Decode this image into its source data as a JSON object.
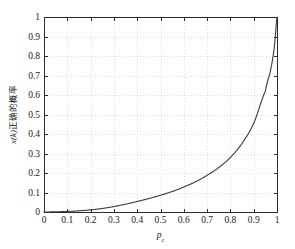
{
  "figure": {
    "background_color": "#ffffff",
    "plot_area": {
      "left": 44,
      "top": 17,
      "right": 277,
      "bottom": 212
    }
  },
  "chart_data": {
    "type": "line",
    "title": "",
    "xlabel": "p_c",
    "xlabel_base": "p",
    "xlabel_sub": "c",
    "ylabel": "x(k)正确的概率",
    "ylabel_math": "x(k)",
    "ylabel_cjk": "正确的概率",
    "xlim": [
      0,
      1
    ],
    "ylim": [
      0,
      1
    ],
    "xticks": [
      0,
      0.1,
      0.2,
      0.3,
      0.4,
      0.5,
      0.6,
      0.7,
      0.8,
      0.9,
      1
    ],
    "yticks": [
      0,
      0.1,
      0.2,
      0.3,
      0.4,
      0.5,
      0.6,
      0.7,
      0.8,
      0.9,
      1
    ],
    "xtick_labels": [
      "0",
      "0.1",
      "0.2",
      "0.3",
      "0.4",
      "0.5",
      "0.6",
      "0.7",
      "0.8",
      "0.9",
      "1"
    ],
    "ytick_labels": [
      "0",
      "0.1",
      "0.2",
      "0.3",
      "0.4",
      "0.5",
      "0.6",
      "0.7",
      "0.8",
      "0.9",
      "1"
    ],
    "grid": true,
    "grid_style": "dotted",
    "grid_color": "#c8c8c8",
    "legend": null,
    "line_color": "#3a3a3a",
    "line_width": 1.1,
    "series": [
      {
        "name": "probability x(k) correct",
        "x": [
          0.0,
          0.05,
          0.1,
          0.15,
          0.2,
          0.25,
          0.3,
          0.35,
          0.4,
          0.45,
          0.5,
          0.55,
          0.6,
          0.65,
          0.7,
          0.75,
          0.8,
          0.85,
          0.9,
          0.95,
          0.97,
          0.98,
          0.99,
          1.0
        ],
        "y": [
          0.0,
          0.001,
          0.003,
          0.006,
          0.011,
          0.018,
          0.028,
          0.04,
          0.054,
          0.069,
          0.086,
          0.105,
          0.128,
          0.155,
          0.188,
          0.228,
          0.28,
          0.352,
          0.455,
          0.62,
          0.712,
          0.775,
          0.862,
          1.0
        ]
      }
    ]
  }
}
